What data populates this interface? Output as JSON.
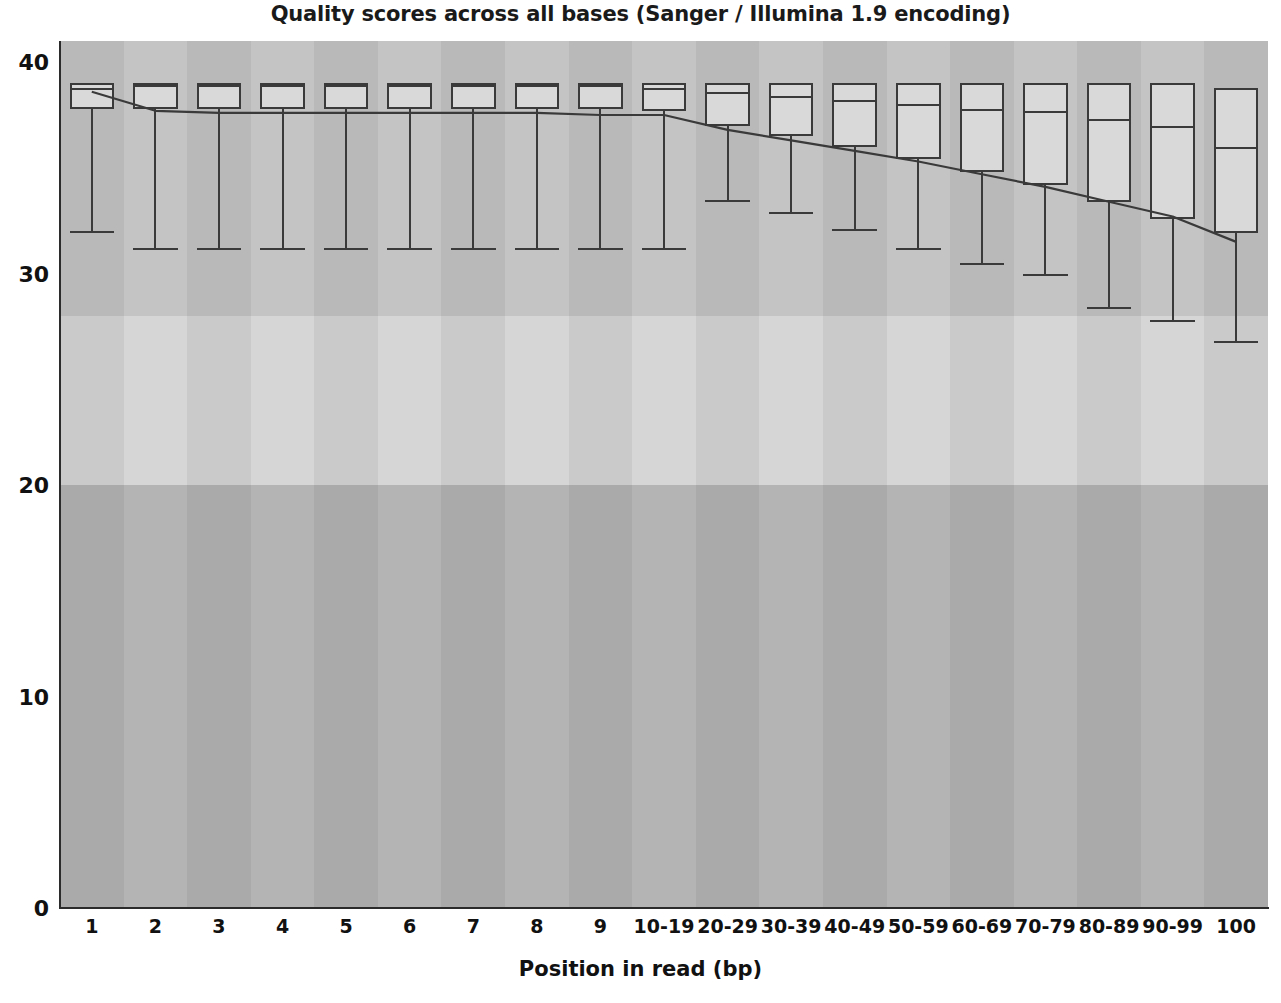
{
  "chart_data": {
    "type": "box",
    "title": "Quality scores across all bases (Sanger / Illumina 1.9 encoding)",
    "xlabel": "Position in read (bp)",
    "ylabel": "",
    "ylim": [
      0,
      41
    ],
    "yticks": [
      0,
      10,
      20,
      30,
      40
    ],
    "ytick_labels": [
      "0",
      "10",
      "20",
      "30",
      "40"
    ],
    "grid": false,
    "legend": null,
    "categories": [
      "1",
      "2",
      "3",
      "4",
      "5",
      "6",
      "7",
      "8",
      "9",
      "10-19",
      "20-29",
      "30-39",
      "40-49",
      "50-59",
      "60-69",
      "70-79",
      "80-89",
      "90-99",
      "100"
    ],
    "background_bands": [
      {
        "label": "good-quality-band",
        "from": 28,
        "to": 41,
        "color": "#c4c4c4"
      },
      {
        "label": "medium-quality-band",
        "from": 20,
        "to": 28,
        "color": "#d6d6d6"
      },
      {
        "label": "poor-quality-band",
        "from": 0,
        "to": 20,
        "color": "#b4b4b4"
      }
    ],
    "series": [
      {
        "name": "Quartile boxes",
        "boxes": [
          {
            "category": "1",
            "whisker_low": 32.0,
            "q1": 37.8,
            "median": 38.8,
            "q3": 39.0,
            "whisker_high": 39.0
          },
          {
            "category": "2",
            "whisker_low": 31.2,
            "q1": 37.8,
            "median": 38.9,
            "q3": 39.0,
            "whisker_high": 39.0
          },
          {
            "category": "3",
            "whisker_low": 31.2,
            "q1": 37.8,
            "median": 38.9,
            "q3": 39.0,
            "whisker_high": 39.0
          },
          {
            "category": "4",
            "whisker_low": 31.2,
            "q1": 37.8,
            "median": 38.9,
            "q3": 39.0,
            "whisker_high": 39.0
          },
          {
            "category": "5",
            "whisker_low": 31.2,
            "q1": 37.8,
            "median": 38.9,
            "q3": 39.0,
            "whisker_high": 39.0
          },
          {
            "category": "6",
            "whisker_low": 31.2,
            "q1": 37.8,
            "median": 38.9,
            "q3": 39.0,
            "whisker_high": 39.0
          },
          {
            "category": "7",
            "whisker_low": 31.2,
            "q1": 37.8,
            "median": 38.9,
            "q3": 39.0,
            "whisker_high": 39.0
          },
          {
            "category": "8",
            "whisker_low": 31.2,
            "q1": 37.8,
            "median": 38.9,
            "q3": 39.0,
            "whisker_high": 39.0
          },
          {
            "category": "9",
            "whisker_low": 31.2,
            "q1": 37.8,
            "median": 38.9,
            "q3": 39.0,
            "whisker_high": 39.0
          },
          {
            "category": "10-19",
            "whisker_low": 31.2,
            "q1": 37.7,
            "median": 38.8,
            "q3": 39.0,
            "whisker_high": 39.0
          },
          {
            "category": "20-29",
            "whisker_low": 33.5,
            "q1": 37.0,
            "median": 38.6,
            "q3": 39.0,
            "whisker_high": 39.0
          },
          {
            "category": "30-39",
            "whisker_low": 32.9,
            "q1": 36.5,
            "median": 38.4,
            "q3": 39.0,
            "whisker_high": 39.0
          },
          {
            "category": "40-49",
            "whisker_low": 32.1,
            "q1": 36.0,
            "median": 38.2,
            "q3": 39.0,
            "whisker_high": 39.0
          },
          {
            "category": "50-59",
            "whisker_low": 31.2,
            "q1": 35.4,
            "median": 38.0,
            "q3": 39.0,
            "whisker_high": 39.0
          },
          {
            "category": "60-69",
            "whisker_low": 30.5,
            "q1": 34.8,
            "median": 37.8,
            "q3": 39.0,
            "whisker_high": 39.0
          },
          {
            "category": "70-79",
            "whisker_low": 30.0,
            "q1": 34.2,
            "median": 37.7,
            "q3": 39.0,
            "whisker_high": 39.0
          },
          {
            "category": "80-89",
            "whisker_low": 28.4,
            "q1": 33.4,
            "median": 37.3,
            "q3": 39.0,
            "whisker_high": 39.0
          },
          {
            "category": "90-99",
            "whisker_low": 27.8,
            "q1": 32.6,
            "median": 37.0,
            "q3": 39.0,
            "whisker_high": 39.0
          },
          {
            "category": "100",
            "whisker_low": 26.8,
            "q1": 31.9,
            "median": 36.0,
            "q3": 38.8,
            "whisker_high": 38.8
          }
        ]
      }
    ],
    "mean_line": {
      "name": "Mean quality",
      "color": "#3a3a3a",
      "values": [
        38.6,
        37.7,
        37.6,
        37.6,
        37.6,
        37.6,
        37.6,
        37.6,
        37.5,
        37.5,
        36.8,
        36.3,
        35.8,
        35.3,
        34.7,
        34.1,
        33.4,
        32.7,
        31.5
      ]
    }
  }
}
